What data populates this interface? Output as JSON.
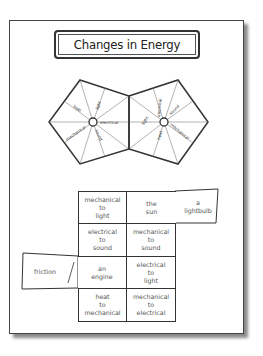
{
  "title": "Changes in Energy",
  "left_wheel": {
    "center_label": "electrical",
    "labels": [
      "heat",
      "light",
      "electrical",
      "sound",
      "mechanical"
    ]
  },
  "right_wheel": {
    "labels": [
      "electrical",
      "sound",
      "mechanical",
      "heat",
      "light"
    ]
  },
  "grid": {
    "rows": [
      [
        "mechanical\nto\nlight",
        "the\nsun"
      ],
      [
        "electrical\nto\nsound",
        "mechanical\nto\nsound"
      ],
      [
        "an\nengine",
        "electrical\nto\nlight"
      ],
      [
        "heat\nto\nmechanical",
        "mechanical\nto\nelectrical"
      ]
    ],
    "flap_right": "a\nlightbulb",
    "flap_left": "friction"
  },
  "colors": {
    "line": "#333333",
    "text": "#555555",
    "shadow": "#8a8a8a"
  }
}
